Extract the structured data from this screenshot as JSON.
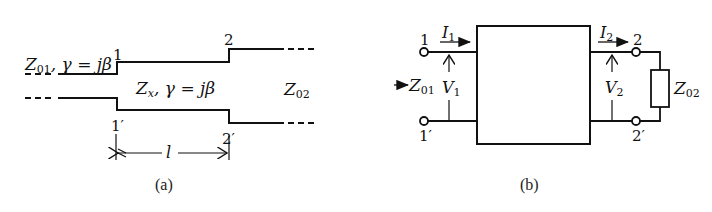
{
  "figure_a": {
    "caption": "(a)",
    "labels": {
      "left_line_Z": "Z",
      "left_line_Z_sub": "01",
      "left_line_gamma": ", γ = jβ",
      "mid_line_Z": "Z",
      "mid_line_Z_sub": "x",
      "mid_line_gamma": ", γ = jβ",
      "right_line_Z": "Z",
      "right_line_Z_sub": "02",
      "port_1": "1",
      "port_1p": "1′",
      "port_2": "2",
      "port_2p": "2′",
      "length": "l"
    }
  },
  "figure_b": {
    "caption": "(b)",
    "labels": {
      "port_1": "1",
      "port_1p": "1′",
      "port_2": "2",
      "port_2p": "2′",
      "I1": "I",
      "I1_sub": "1",
      "I2": "I",
      "I2_sub": "2",
      "V1": "V",
      "V1_sub": "1",
      "V2": "V",
      "V2_sub": "2",
      "Z01": "Z",
      "Z01_sub": "01",
      "Z02": "Z",
      "Z02_sub": "02"
    }
  },
  "colors": {
    "stroke": "#111111",
    "background": "#ffffff"
  }
}
